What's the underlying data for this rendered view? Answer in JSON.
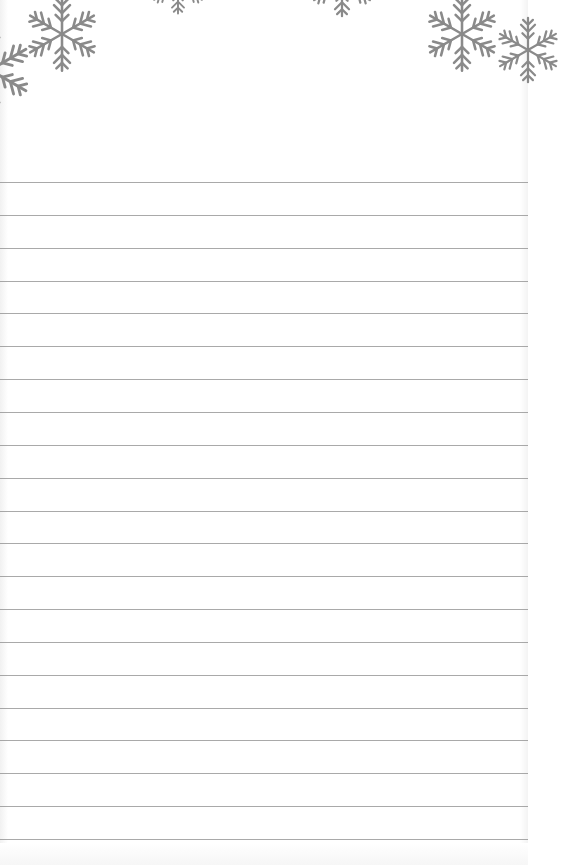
{
  "page": {
    "type": "lined-notepad",
    "background_color": "#ffffff",
    "line_color": "#8c8c8c",
    "snowflake_color": "#8a8a8a",
    "line_count": 21,
    "first_line_y": 182,
    "line_spacing": 32.85
  },
  "decorations": [
    {
      "icon": "snowflake-icon",
      "x": 62,
      "y": 34,
      "size": 80
    },
    {
      "icon": "snowflake-icon",
      "x": 178,
      "y": -14,
      "size": 60
    },
    {
      "icon": "snowflake-icon",
      "x": 342,
      "y": -16,
      "size": 70
    },
    {
      "icon": "snowflake-icon",
      "x": 462,
      "y": 34,
      "size": 80
    },
    {
      "icon": "snowflake-icon",
      "x": -10,
      "y": 70,
      "size": 90
    },
    {
      "icon": "snowflake-icon",
      "x": 528,
      "y": 50,
      "size": 70
    }
  ],
  "lines": []
}
